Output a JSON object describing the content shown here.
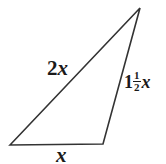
{
  "figure": {
    "background_color": "#ffffff",
    "stroke_color": "#333333",
    "text_color": "#1a1a1a",
    "width": 166,
    "height": 164
  },
  "shape": {
    "type": "triangle",
    "vertices": [
      {
        "name": "bottom-left",
        "x": 10,
        "y": 145
      },
      {
        "name": "apex-top-right",
        "x": 140,
        "y": 8
      },
      {
        "name": "bottom-right",
        "x": 103,
        "y": 144
      }
    ],
    "stroke_width": 1.6
  },
  "labels": {
    "left_side": {
      "name": "2x",
      "coefficient": "2",
      "variable": "x"
    },
    "right_side": {
      "name": "1 1/2 x",
      "whole": "1",
      "numerator": "1",
      "denominator": "2",
      "variable": "x"
    },
    "base_side": {
      "name": "x",
      "variable": "x"
    }
  }
}
